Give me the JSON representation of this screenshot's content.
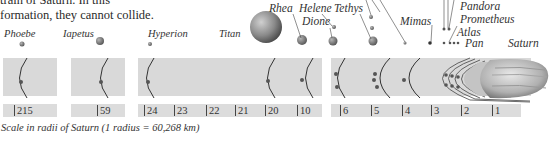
{
  "intro_text": {
    "line1": "train of Saturn. In this",
    "line2": "formation, they cannot collide."
  },
  "moons": [
    {
      "name": "Phoebe"
    },
    {
      "name": "Iapetus"
    },
    {
      "name": "Hyperion"
    },
    {
      "name": "Titan"
    },
    {
      "name": "Rhea"
    },
    {
      "name": "Helene"
    },
    {
      "name": "Dione"
    },
    {
      "name": "Tethys"
    },
    {
      "name": "Mimas"
    },
    {
      "name": "Pandora"
    },
    {
      "name": "Prometheus"
    },
    {
      "name": "Atlas"
    },
    {
      "name": "Pan"
    },
    {
      "name": "Saturn"
    }
  ],
  "scale_ticks": [
    "215",
    "59",
    "24",
    "23",
    "22",
    "21",
    "20",
    "10",
    "6",
    "5",
    "4",
    "3",
    "2",
    "1"
  ],
  "caption": "Scale in radii of Saturn (1 radius = 60,268 km)",
  "colors": {
    "panel": "#d9d9d9",
    "orbit_line": "#333333",
    "moon": "#7a7a7a",
    "text": "#333333"
  }
}
